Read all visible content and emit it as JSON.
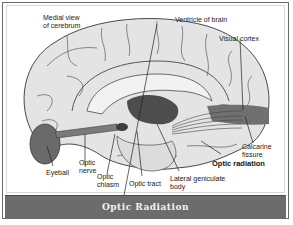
{
  "diagram": {
    "title": "Optic Radiation",
    "labels": {
      "medial_view": "Medial view\nof cerebrum",
      "ventricle": "Ventricle of brain",
      "visual_cortex": "Visual cortex",
      "eyeball": "Eyeball",
      "optic_nerve": "Optic\nnerve",
      "optic_chiasm": "Optic\nchiasm",
      "optic_tract": "Optic tract",
      "lateral_geniculate": "Lateral geniculate\nbody",
      "optic_radiation": "Optic radiation",
      "calcarine_fissure": "Calcarine\nfissure"
    },
    "colors": {
      "brain_fill": "#e4e4e4",
      "gyri_lines": "#555555",
      "dark_structures": "#4d4d4d",
      "visual_cortex_band": "#707070",
      "caption_bg": "#6c6c6c",
      "caption_text": "#f2f2f2"
    }
  }
}
